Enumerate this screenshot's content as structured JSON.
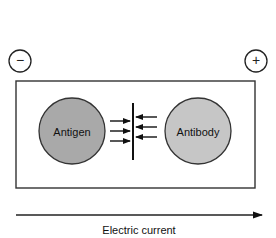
{
  "diagram": {
    "electrodes": {
      "negative": {
        "symbol": "−"
      },
      "positive": {
        "symbol": "+"
      }
    },
    "antigen": {
      "label": "Antigen",
      "fill": "#a8a8a8"
    },
    "antibody": {
      "label": "Antibody",
      "fill": "#c4c4c4"
    },
    "precipitin_line": true,
    "arrows_from_antigen": 3,
    "arrows_from_antibody": 3,
    "current": {
      "label": "Electric current",
      "direction": "left-to-right"
    }
  }
}
